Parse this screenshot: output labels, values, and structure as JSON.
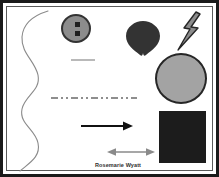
{
  "canvas": {
    "title": "Shapes drawing canvas",
    "background_color": "#ffffff",
    "border_color": "#1a1a1a",
    "inner_border_color": "#5a5a5a",
    "width": 219,
    "height": 177
  },
  "caption": {
    "text": "Rosemarie Wyatt",
    "color": "#2e2e2e"
  },
  "shapes": {
    "wavy_curve": {
      "name": "wavy-curve",
      "stroke_color": "#8a8a8a",
      "stroke_width": 1
    },
    "button_circle": {
      "name": "button-circle",
      "fill_color": "#8c8c8c",
      "outline_color": "#333333",
      "hole_color": "#1f1f1f",
      "hole_count": 2
    },
    "gray_line_short": {
      "name": "gray-line-short",
      "color": "#b9b9b9",
      "style": "solid"
    },
    "dash_dot_line": {
      "name": "dash-dot-line",
      "color": "#8e8e8e",
      "style": "dash-dot-dot"
    },
    "heart": {
      "name": "heart-shape",
      "fill_color": "#333333",
      "orientation": "point-down"
    },
    "lightning_bolt": {
      "name": "lightning-bolt",
      "fill_color": "#8c8c8c",
      "outline_color": "#262626"
    },
    "big_circle": {
      "name": "big-circle",
      "fill_color": "#a3a3a3",
      "outline_color": "#262626"
    },
    "dark_square": {
      "name": "dark-square",
      "fill_color": "#1c1c1c"
    },
    "black_arrow": {
      "name": "black-arrow",
      "color": "#111111",
      "direction": "right",
      "heads": 1
    },
    "double_arrow": {
      "name": "double-arrow",
      "color": "#8a8a8a",
      "direction": "left-right",
      "heads": 2
    }
  }
}
